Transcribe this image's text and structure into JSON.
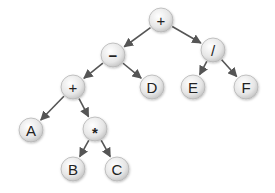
{
  "diagram": {
    "type": "expression-tree",
    "nodes": [
      {
        "id": "n1",
        "label": "+",
        "x": 161,
        "y": 20
      },
      {
        "id": "n2",
        "label": "−",
        "x": 113,
        "y": 55
      },
      {
        "id": "n3",
        "label": "/",
        "x": 213,
        "y": 50
      },
      {
        "id": "n4",
        "label": "+",
        "x": 73,
        "y": 87
      },
      {
        "id": "n5",
        "label": "D",
        "x": 152,
        "y": 87
      },
      {
        "id": "n6",
        "label": "E",
        "x": 193,
        "y": 87
      },
      {
        "id": "n7",
        "label": "F",
        "x": 246,
        "y": 87
      },
      {
        "id": "n8",
        "label": "A",
        "x": 31,
        "y": 130
      },
      {
        "id": "n9",
        "label": "*",
        "x": 95,
        "y": 129
      },
      {
        "id": "n10",
        "label": "B",
        "x": 73,
        "y": 169
      },
      {
        "id": "n11",
        "label": "C",
        "x": 117,
        "y": 169
      }
    ],
    "edges": [
      {
        "from": "n1",
        "to": "n2"
      },
      {
        "from": "n1",
        "to": "n3"
      },
      {
        "from": "n2",
        "to": "n4"
      },
      {
        "from": "n2",
        "to": "n5"
      },
      {
        "from": "n3",
        "to": "n6"
      },
      {
        "from": "n3",
        "to": "n7"
      },
      {
        "from": "n4",
        "to": "n8"
      },
      {
        "from": "n4",
        "to": "n9"
      },
      {
        "from": "n9",
        "to": "n10"
      },
      {
        "from": "n9",
        "to": "n11"
      }
    ],
    "node_radius": 12,
    "colors": {
      "edge": "#555555",
      "node_fill_light": "#ffffff",
      "node_fill_dark": "#cfcfcf",
      "node_stroke": "#b5b5b5",
      "text": "#222222"
    }
  }
}
